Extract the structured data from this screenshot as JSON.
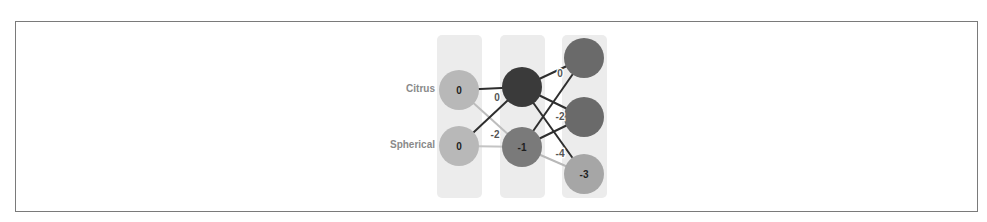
{
  "diagram": {
    "title": "",
    "inputs": [
      {
        "label": "Citrus",
        "value": "0",
        "cx": 459,
        "cy": 90,
        "color": "#b8b8b8"
      },
      {
        "label": "Spherical",
        "value": "0",
        "cx": 459,
        "cy": 146,
        "color": "#b8b8b8"
      }
    ],
    "hidden": [
      {
        "value": "",
        "cx": 522,
        "cy": 87,
        "color": "#3a3a3a"
      },
      {
        "value": "-1",
        "cx": 522,
        "cy": 147,
        "color": "#7a7a7a"
      }
    ],
    "outputs": [
      {
        "value": "",
        "cx": 584,
        "cy": 58,
        "color": "#6a6a6a"
      },
      {
        "value": "",
        "cx": 584,
        "cy": 117,
        "color": "#6a6a6a"
      },
      {
        "value": "-3",
        "cx": 584,
        "cy": 174,
        "color": "#a6a6a6"
      }
    ],
    "edge_labels": [
      {
        "text": "0",
        "x": 497,
        "y": 101
      },
      {
        "text": "-2",
        "x": 495,
        "y": 138
      },
      {
        "text": "0",
        "x": 560,
        "y": 77
      },
      {
        "text": "-2",
        "x": 560,
        "y": 120
      },
      {
        "text": "-4",
        "x": 560,
        "y": 157
      }
    ],
    "columns": [
      {
        "name": "input-layer",
        "x": 437,
        "y": 35,
        "w": 45,
        "h": 163
      },
      {
        "name": "hidden-layer",
        "x": 500,
        "y": 35,
        "w": 45,
        "h": 163
      },
      {
        "name": "output-layer",
        "x": 562,
        "y": 35,
        "w": 45,
        "h": 163
      }
    ]
  }
}
